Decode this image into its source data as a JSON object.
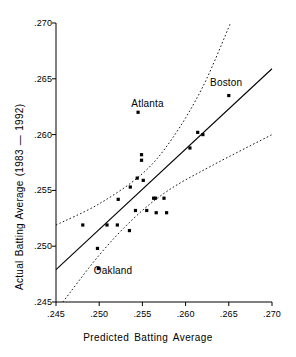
{
  "chart_data": {
    "type": "scatter",
    "title": "",
    "xlabel": "Predicted Batting Average",
    "ylabel": "Actual Batting Average (1983 — 1992)",
    "xlim": [
      0.245,
      0.27
    ],
    "ylim": [
      0.245,
      0.27
    ],
    "xticks": [
      ".245",
      ".250",
      ".255",
      ".260",
      ".265",
      ".270"
    ],
    "yticks": [
      ".245",
      ".250",
      ".255",
      ".260",
      ".265",
      ".270"
    ],
    "xtick_values": [
      0.245,
      0.25,
      0.255,
      0.26,
      0.265,
      0.27
    ],
    "ytick_values": [
      0.245,
      0.25,
      0.255,
      0.26,
      0.265,
      0.27
    ],
    "grid": false,
    "legend": "none",
    "marker": "filled-square",
    "marker_color": "#000000",
    "line_color": "#000000",
    "band_style": "dotted",
    "points": [
      {
        "x": 0.2481,
        "y": 0.2519
      },
      {
        "x": 0.2498,
        "y": 0.2498
      },
      {
        "x": 0.2499,
        "y": 0.248
      },
      {
        "x": 0.2509,
        "y": 0.2519
      },
      {
        "x": 0.2521,
        "y": 0.2519
      },
      {
        "x": 0.2522,
        "y": 0.2542
      },
      {
        "x": 0.2535,
        "y": 0.2514
      },
      {
        "x": 0.2536,
        "y": 0.2553
      },
      {
        "x": 0.2542,
        "y": 0.2532
      },
      {
        "x": 0.2544,
        "y": 0.2561
      },
      {
        "x": 0.2545,
        "y": 0.262
      },
      {
        "x": 0.2549,
        "y": 0.2582
      },
      {
        "x": 0.2549,
        "y": 0.2577
      },
      {
        "x": 0.2551,
        "y": 0.2559
      },
      {
        "x": 0.2555,
        "y": 0.2532
      },
      {
        "x": 0.2563,
        "y": 0.2543
      },
      {
        "x": 0.2565,
        "y": 0.2543
      },
      {
        "x": 0.2566,
        "y": 0.253
      },
      {
        "x": 0.2575,
        "y": 0.2543
      },
      {
        "x": 0.2578,
        "y": 0.253
      },
      {
        "x": 0.2605,
        "y": 0.2588
      },
      {
        "x": 0.2614,
        "y": 0.2602
      },
      {
        "x": 0.262,
        "y": 0.26
      },
      {
        "x": 0.265,
        "y": 0.2635
      }
    ],
    "annotations": [
      {
        "label": "Atlanta",
        "x": 0.2556,
        "y": 0.2627
      },
      {
        "label": "Boston",
        "x": 0.2647,
        "y": 0.2646
      },
      {
        "label": "Oakland",
        "x": 0.2516,
        "y": 0.2478
      }
    ],
    "fit_line": {
      "x0": 0.245,
      "y0": 0.2479,
      "x1": 0.27,
      "y1": 0.2659
    },
    "upper_band": [
      {
        "x": 0.245,
        "y": 0.2519
      },
      {
        "x": 0.25,
        "y": 0.2538
      },
      {
        "x": 0.255,
        "y": 0.2565
      },
      {
        "x": 0.2585,
        "y": 0.2597
      },
      {
        "x": 0.262,
        "y": 0.2643
      },
      {
        "x": 0.2652,
        "y": 0.27
      }
    ],
    "lower_band": [
      {
        "x": 0.2458,
        "y": 0.245
      },
      {
        "x": 0.25,
        "y": 0.2492
      },
      {
        "x": 0.254,
        "y": 0.2525
      },
      {
        "x": 0.258,
        "y": 0.255
      },
      {
        "x": 0.263,
        "y": 0.2572
      },
      {
        "x": 0.27,
        "y": 0.26
      }
    ]
  }
}
